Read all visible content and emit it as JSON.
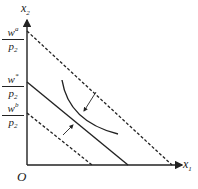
{
  "diagram": {
    "axes": {
      "y_label": "x",
      "y_label_sub": "2",
      "x_label": "x",
      "x_label_sub": "1",
      "origin_label": "O"
    },
    "y_intercepts": [
      {
        "num": "w",
        "num_sup": "a",
        "den": "p",
        "den_sub": "2",
        "style": "dashed"
      },
      {
        "num": "w",
        "num_sup": "*",
        "den": "p",
        "den_sub": "2",
        "style": "solid"
      },
      {
        "num": "w",
        "num_sup": "b",
        "den": "p",
        "den_sub": "2",
        "style": "dashed"
      }
    ],
    "colors": {
      "line": "#222222",
      "background": "#ffffff"
    }
  }
}
